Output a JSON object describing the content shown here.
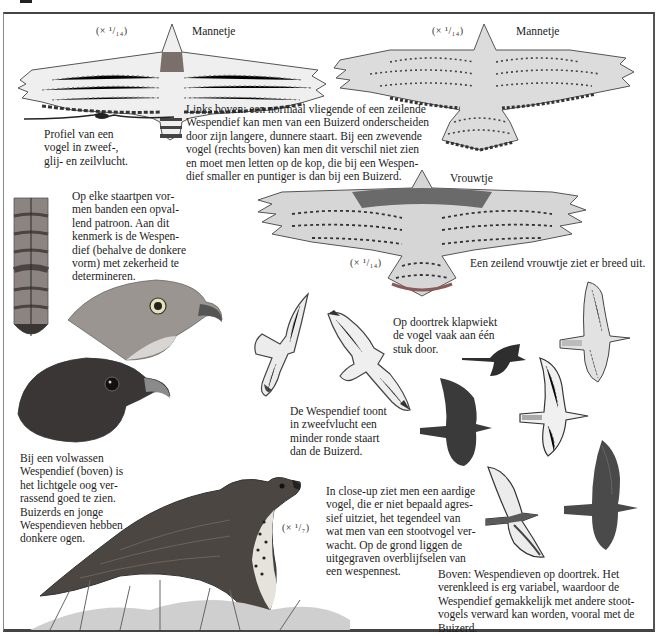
{
  "page": {
    "subject": "Wespendief",
    "colors": {
      "ink": "#1c1c1c",
      "frame": "#444444",
      "paper": "#ffffff",
      "plumage_dark": "#3a3a3a",
      "plumage_light": "#d8d8d8"
    }
  },
  "top_left_bird": {
    "scale": "(× ¹/₁₄)",
    "label": "Mannetje"
  },
  "top_right_bird": {
    "scale": "(× ¹/₁₄)",
    "label": "Mannetje"
  },
  "profile": {
    "caption": "Profiel van een\nvogel in zweef-,\nglij- en zeilvlucht."
  },
  "intro_text": "Links boven: een normaal vliegende of een zeilende\nWespendief kan men van een Buizerd onderscheiden\ndoor zijn langere, dunnere staart. Bij een zwevende\nvogel (rechts boven) kan men dit verschil niet zien\nen moet men letten op de kop, die bij een Wespen-\ndief smaller en puntiger is dan bij een Buizerd.",
  "female_bird": {
    "label": "Vrouwtje",
    "scale": "(× ¹/₁₄)",
    "caption": "Een zeilend vrouwtje ziet er breed uit."
  },
  "tail_feather": {
    "caption": "Op elke staartpen vor-\nmen banden een opval-\nlend patroon. Aan dit\nkenmerk is de Wespen-\ndief (behalve de donkere\nvorm) met zekerheid te\ndetermineren."
  },
  "heads": {
    "caption": "Bij een volwassen\nWespendief (boven) is\nhet lichtgele oog ver-\nrassend goed te zien.\nBuizerds en jonge\nWespendieven hebben\ndonkere ogen."
  },
  "flapping": {
    "caption": "Op doortrek klapwiekt\nde vogel vaak aan één\nstuk door."
  },
  "gliding": {
    "caption": "De Wespendief toont\nin zweefvlucht een\nminder ronde staart\ndan de Buizerd."
  },
  "perched_bird": {
    "scale": "(× ¹/₇)",
    "caption": "In close-up ziet men een aardige\nvogel, die er niet bepaald agres-\nsief uitziet, het tegendeel van\nwat men van een stootvogel ver-\nwacht. Op de grond liggen de\nuitgegraven overblijfselen van\neen wespennest."
  },
  "migration": {
    "caption": "Boven: Wespendieven op doortrek. Het\nverenkleed is erg variabel, waardoor de\nWespendief gemakkelijk met andere stoot-\nvogels verward kan worden, vooral met de\nBuizerd."
  }
}
